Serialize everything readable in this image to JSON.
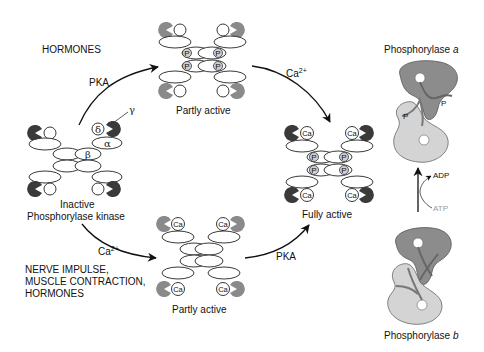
{
  "stimuli": {
    "hormones_top": "HORMONES",
    "bottom_line1": "NERVE IMPULSE,",
    "bottom_line2": "MUSCLE CONTRACTION,",
    "bottom_line3": "HORMONES"
  },
  "enzymes": {
    "inactive_line1": "Inactive",
    "inactive_line2": "Phosphorylase kinase",
    "partly_active_top": "Partly active",
    "partly_active_bottom": "Partly active",
    "fully_active": "Fully active"
  },
  "arrows": {
    "pka_top": "PKA",
    "ca_top": "Ca",
    "ca_top_sup": "2+",
    "ca_bottom": "Ca",
    "ca_bottom_sup": "2+",
    "pka_bottom": "PKA"
  },
  "subunits": {
    "gamma": "γ",
    "delta": "δ",
    "alpha": "α",
    "beta": "β",
    "phosphate": "P",
    "calcium": "Ca"
  },
  "phosphorylase": {
    "a_label": "Phosphorylase ",
    "a_italic": "a",
    "b_label": "Phosphorylase ",
    "b_italic": "b",
    "adp": "ADP",
    "atp": "ATP",
    "phosphate": "P"
  },
  "colors": {
    "dark_subunit": "#3d3d3d",
    "gray_subunit": "#8a8a8a",
    "phosphate_fill": "#cfcfcf",
    "phosphorylase_dark": "#8c8c8c",
    "phosphorylase_light": "#d4d4d4",
    "atp_gray": "#9a9a9a"
  }
}
